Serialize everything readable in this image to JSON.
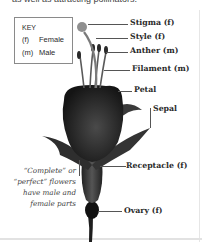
{
  "header": {
    "cut_off_text": "as well as attracting pollinators."
  },
  "key": {
    "title": "KEY",
    "entries": [
      {
        "abbr": "(f)",
        "label": "Female"
      },
      {
        "abbr": "(m)",
        "label": "Male"
      }
    ]
  },
  "labels": {
    "stigma": "Stigma (f)",
    "style": "Style (f)",
    "anther": "Anther (m)",
    "filament": "Filament (m)",
    "petal": "Petal",
    "sepal": "Sepal",
    "receptacle": "Receptacle (f)",
    "ovary": "Ovary (f)"
  },
  "note": "“Complete” or “perfect” flowers have male and female parts",
  "colors": {
    "flower_dark": "#1e1e1e",
    "flower_mid": "#3a3a3a",
    "flower_light": "#6b6b6b",
    "stigma": "#8a8a8a",
    "text": "#2a2a2a",
    "leader": "#555555"
  }
}
